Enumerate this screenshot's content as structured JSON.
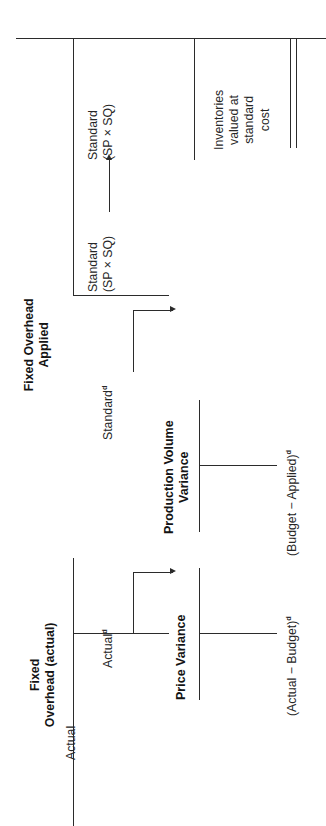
{
  "exhibit": {
    "title": "Fixed Overhead Variance Analysis",
    "top_rule": true,
    "double_rule": true
  },
  "columns": [
    {
      "id": "fixed-overhead-actual",
      "header": "Fixed\nOverhead (actual)",
      "amount": "Actual",
      "amount_superscript": "d",
      "base_label": "Actual"
    },
    {
      "id": "fixed-overhead-applied",
      "header": "Fixed Overhead\nApplied",
      "amount": "Standard",
      "amount_superscript": "d",
      "base_label": "Standard\n(SP × SQ)"
    },
    {
      "id": "standard-cost-out",
      "header": "",
      "amount": "",
      "amount_superscript": "",
      "base_label": "Standard\n(SP × SQ)"
    }
  ],
  "variances": [
    {
      "id": "price-variance",
      "name": "Price Variance",
      "formula": "(Actual − Budget)",
      "formula_superscript": "d"
    },
    {
      "id": "production-volume-variance",
      "name": "Production Volume\nVariance",
      "formula": "(Budget − Applied)",
      "formula_superscript": "d"
    }
  ],
  "notes": {
    "inventories": "Inventories\nvalued at\nstandard\ncost"
  },
  "axis_labels": {
    "actual_column": "Actual",
    "standard_sp_sq": "Standard\n(SP × SQ)"
  },
  "colors": {
    "ink": "#2b2b2b",
    "background": "#ffffff"
  }
}
